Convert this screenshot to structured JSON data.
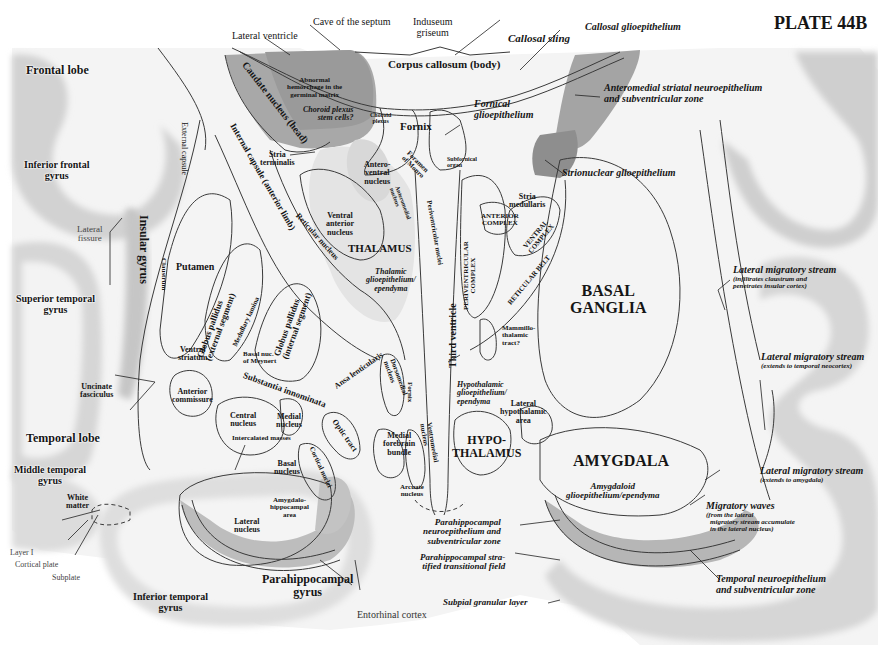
{
  "plate_title": "PLATE 44B",
  "regions": {
    "frontal_lobe": "Frontal lobe",
    "inferior_frontal_gyrus": [
      "Inferior frontal",
      "gyrus"
    ],
    "insular_gyrus": "Insular gyrus",
    "lateral_fissure": [
      "Lateral",
      "fissure"
    ],
    "superior_temporal_gyrus": [
      "Superior temporal",
      "gyrus"
    ],
    "temporal_lobe": "Temporal lobe",
    "middle_temporal_gyrus": [
      "Middle temporal",
      "gyrus"
    ],
    "white_matter": [
      "White",
      "matter"
    ],
    "inferior_temporal_gyrus": [
      "Inferior temporal",
      "gyrus"
    ],
    "parahippocampal_gyrus": [
      "Parahippocampal",
      "gyrus"
    ],
    "entorhinal_cortex": "Entorhinal cortex",
    "layer_i": "Layer I",
    "cortical_plate": "Cortical plate",
    "subplate": "Subplate"
  },
  "left_structures": {
    "cave_of_septum": "Cave of the septum",
    "lateral_ventricle": "Lateral ventricle",
    "induseum_griseum": [
      "Induseum",
      "griseum"
    ],
    "corpus_callosum": "Corpus callosum (body)",
    "caudate_nucleus": "Caudate nucleus (head)",
    "abnormal_hemorrhage": [
      "Abnormal",
      "hemorrhage in the",
      "germinal matrix"
    ],
    "choroid_plexus_stem": [
      "Choroid plexus",
      "stem cells?"
    ],
    "choroid_plexus": [
      "Choroid",
      "plexus"
    ],
    "fornix": "Fornix",
    "foramen_of_monro": [
      "Foramen",
      "of Monro"
    ],
    "subfornical_organ": [
      "Subfornical",
      "organ"
    ],
    "external_capsule": "External capsule",
    "internal_capsule": "Internal capsule (anterior limb)",
    "stria_terminalis": [
      "Stria",
      "terminalis"
    ],
    "anteroventral_nucleus": [
      "Antero-",
      "ventral",
      "nucleus"
    ],
    "anteromedial_nucleus": [
      "Anteromedial",
      "nucleus"
    ],
    "periventricular_nuclei": "Periventricular nuclei",
    "ventral_anterior_nucleus": [
      "Ventral",
      "anterior",
      "nucleus"
    ],
    "reticular_nucleus": "Reticular nucleus",
    "thalamus": "THALAMUS",
    "thalamic_glioepithelium": [
      "Thalamic",
      "glioepithelium/",
      "ependyma"
    ],
    "putamen": "Putamen",
    "claustrum": "Claustrum",
    "globus_pallidus_external": [
      "Globus pallidus",
      "(external segment)"
    ],
    "globus_pallidus_internal": [
      "Globus pallidus",
      "(internal segment)"
    ],
    "medullary_lamina": "Medullary lamina",
    "ventral_striatum": [
      "Ventral",
      "striatum"
    ],
    "basal_nuc_meynert": [
      "Basal nuc.",
      "of Meynert"
    ],
    "substantia_innominata": "Substantia innominata",
    "ansa_lenticularis": "Ansa lenticularis",
    "uncinate_fasciculus": [
      "Uncinate",
      "fasciculus"
    ],
    "anterior_commissure": [
      "Anterior",
      "commissure"
    ],
    "central_nucleus": [
      "Central",
      "nucleus"
    ],
    "medial_nucleus": [
      "Medial",
      "nucleus"
    ],
    "intercalated_masses": "Intercalated masses",
    "basal_nucleus": [
      "Basal",
      "nucleus"
    ],
    "cortical_nuclei": "Cortical nuclei",
    "optic_tract": "Optic tract",
    "amygdalo_hippocampal_area": [
      "Amygdalo-",
      "hippocampal",
      "area"
    ],
    "lateral_nucleus": [
      "Lateral",
      "nucleus"
    ],
    "dorsomedial_nucleus": [
      "Dorsomedial",
      "nucleus"
    ],
    "fornix_small": "Fornix",
    "medial_forebrain_bundle": [
      "Medial",
      "forebrain",
      "bundle"
    ],
    "ventromedial_nucleus": [
      "Ventromedial",
      "nucleus"
    ],
    "arcuate_nucleus": [
      "Arcuate",
      "nucleus"
    ],
    "third_ventricle": "Third ventricle"
  },
  "right_structures": {
    "callosal_sling": "Callosal sling",
    "callosal_glioepithelium": "Callosal glioepithelium",
    "fornical_glioepithelium": [
      "Fornical",
      "glioepithelium"
    ],
    "anteromedial_striatal": [
      "Anteromedial striatal neuroepithelium",
      "and subventricular zone"
    ],
    "strionuclear_glioepithelium": "Strionuclear glioepithelium",
    "stria_medullaris": [
      "Stria",
      "medullaris"
    ],
    "anterior_complex": [
      "ANTERIOR",
      "COMPLEX"
    ],
    "ventral_complex": [
      "VENTRAL",
      "COMPLEX"
    ],
    "periventricular_complex": [
      "PERIVENTRICULAR",
      "COMPLEX"
    ],
    "reticular_belt": "RETICULAR BELT",
    "basal_ganglia": [
      "BASAL",
      "GANGLIA"
    ],
    "mammillothalamic_tract": [
      "Mammillo-",
      "thalamic",
      "tract?"
    ],
    "hypothalamic_glioepithelium": [
      "Hypothalamic",
      "glioepithelium/",
      "ependyma"
    ],
    "lateral_hypothalamic_area": [
      "Lateral",
      "hypothalamic",
      "area"
    ],
    "hypothalamus": [
      "HYPO-",
      "THALAMUS"
    ],
    "amygdala": "AMYGDALA",
    "amygdaloid_glioepithelium": [
      "Amygdaloid",
      "glioepithelium/ependyma"
    ],
    "lms_insular": [
      "Lateral migratory stream",
      "(infiltrates claustrum and",
      "penetrates insular cortex)"
    ],
    "lms_temporal": [
      "Lateral migratory stream",
      "(extends to temporal neocortex)"
    ],
    "lms_amygdala": [
      "Lateral migratory stream",
      "(extends to amygdala)"
    ],
    "migratory_waves": [
      "Migratory waves",
      "(from the lateral",
      "migratory stream accumulate",
      "in the lateral nucleus)"
    ],
    "parahippocampal_neuroepithelium": [
      "Parahippocampal",
      "neuroepithelium and",
      "subventricular zone"
    ],
    "parahippocampal_stratified": [
      "Parahippocampal stra-",
      "tified transitional field"
    ],
    "temporal_neuroepithelium": [
      "Temporal neuroepithelium",
      "and subventricular zone"
    ],
    "subpial_granular_layer": "Subpial granular layer"
  },
  "colors": {
    "cortex_gray": "#cfcfcf",
    "tissue_light": "#ececec",
    "germinal_dark": "#9c9c9c",
    "outline": "#3a3a3a"
  }
}
